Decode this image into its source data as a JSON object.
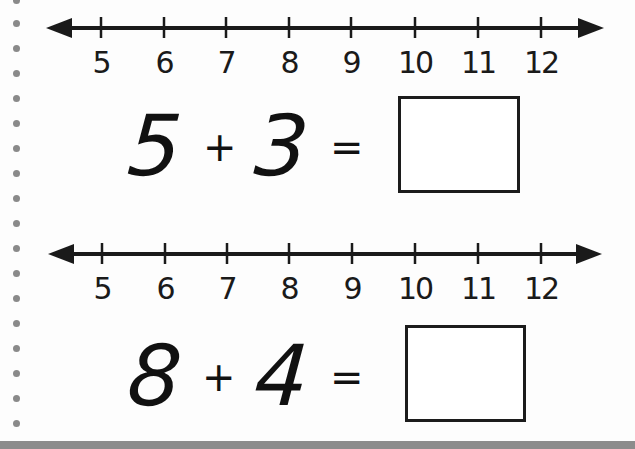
{
  "worksheet": {
    "binder_dots_count": 17,
    "colors": {
      "ink": "#1a1a1a",
      "dots": "#8a8a8a",
      "bottom_band": "#8c8c8c",
      "paper": "#fdfdfd"
    },
    "problems": [
      {
        "number_line": {
          "ticks": [
            "5",
            "6",
            "7",
            "8",
            "9",
            "10",
            "11",
            "12"
          ]
        },
        "equation": {
          "addend1": "5",
          "operator": "+",
          "addend2": "3",
          "equals": "=",
          "answer": ""
        }
      },
      {
        "number_line": {
          "ticks": [
            "5",
            "6",
            "7",
            "8",
            "9",
            "10",
            "11",
            "12"
          ]
        },
        "equation": {
          "addend1": "8",
          "operator": "+",
          "addend2": "4",
          "equals": "=",
          "answer": ""
        }
      }
    ]
  }
}
